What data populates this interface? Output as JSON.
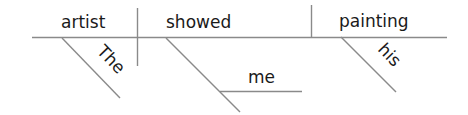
{
  "diagram": {
    "type": "sentence-diagram",
    "sentence": "The artist showed me his painting",
    "subject": "artist",
    "verb": "showed",
    "direct_object": "painting",
    "subject_modifier": "The",
    "indirect_object": "me",
    "object_modifier": "his",
    "line_color": "#8a8a8a",
    "text_color": "#1a1a1a"
  }
}
